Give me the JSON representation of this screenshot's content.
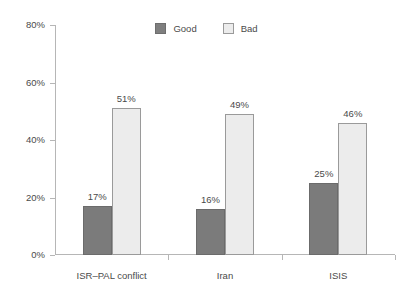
{
  "chart_data": {
    "type": "bar",
    "title": "",
    "subtitle": "",
    "xlabel": "",
    "ylabel": "",
    "ylim": [
      0,
      80
    ],
    "yticks": [
      "0%",
      "20%",
      "40%",
      "60%",
      "80%"
    ],
    "ytick_values": [
      0,
      20,
      40,
      60,
      80
    ],
    "grid": false,
    "legend_position": "top-center",
    "categories": [
      "ISR–PAL conflict",
      "Iran",
      "ISIS"
    ],
    "series": [
      {
        "name": "Good",
        "color": "#7b7b7b",
        "values": [
          17,
          16,
          25
        ],
        "labels": [
          "17%",
          "16%",
          "25%"
        ]
      },
      {
        "name": "Bad",
        "color": "#ececec",
        "values": [
          51,
          49,
          46
        ],
        "labels": [
          "51%",
          "49%",
          "46%"
        ]
      }
    ]
  },
  "legend": {
    "items": [
      {
        "label": "Good",
        "swatch": "good-swatch-icon"
      },
      {
        "label": "Bad",
        "swatch": "bad-swatch-icon"
      }
    ]
  },
  "axis": {
    "y_labels": [
      "80%",
      "60%",
      "40%",
      "20%",
      "0%"
    ],
    "x_labels": [
      "ISR–PAL conflict",
      "Iran",
      "ISIS"
    ]
  },
  "colors": {
    "good": "#7b7b7b",
    "good_border": "#6b6b6b",
    "bad": "#ececec",
    "bad_border": "#9a9a9a",
    "axis": "#b6b6b6",
    "text": "#4a4a4a",
    "background": "#ffffff"
  }
}
